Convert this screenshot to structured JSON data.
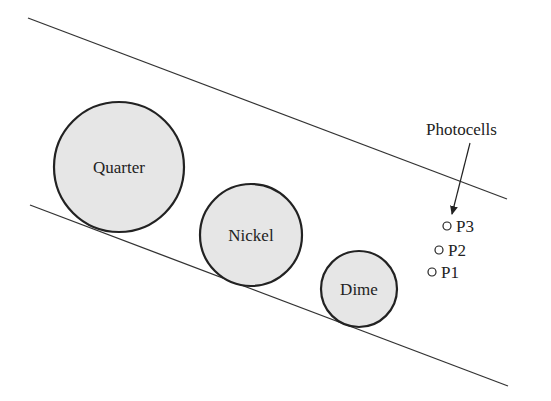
{
  "diagram": {
    "rails": {
      "upper": {
        "x1": 28,
        "y1": 18,
        "x2": 507,
        "y2": 199
      },
      "lower": {
        "x1": 30,
        "y1": 205,
        "x2": 508,
        "y2": 386
      }
    },
    "coins": [
      {
        "label": "Quarter",
        "cx": 119,
        "cy": 167,
        "r": 65
      },
      {
        "label": "Nickel",
        "cx": 251,
        "cy": 235,
        "r": 51
      },
      {
        "label": "Dime",
        "cx": 359,
        "cy": 289,
        "r": 38
      }
    ],
    "photocells": {
      "title": "Photocells",
      "items": [
        {
          "label": "P3",
          "cx": 447,
          "cy": 226
        },
        {
          "label": "P2",
          "cx": 439,
          "cy": 250
        },
        {
          "label": "P1",
          "cx": 432,
          "cy": 272
        }
      ]
    },
    "colors": {
      "coin_fill": "#e6e6e6",
      "stroke": "#222222"
    }
  }
}
